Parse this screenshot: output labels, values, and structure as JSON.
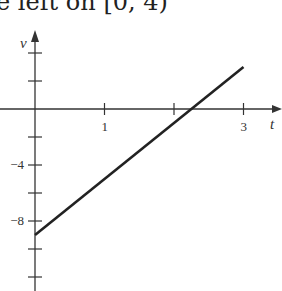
{
  "caption": "e left on [0, 4)",
  "chart_data": {
    "type": "line",
    "title": "",
    "xlabel": "t",
    "ylabel": "v",
    "x_ticks": [
      0,
      1,
      2,
      3
    ],
    "x_tick_labels": [
      "",
      "1",
      "",
      "3"
    ],
    "y_ticks": [
      4,
      2,
      0,
      -2,
      -4,
      -6,
      -8,
      -10,
      -12
    ],
    "y_tick_labels": [
      "",
      "",
      "",
      "",
      "-4",
      "",
      "-8",
      "",
      ""
    ],
    "xlim": [
      0,
      3.5
    ],
    "ylim": [
      -13,
      5.5
    ],
    "grid": false,
    "series": [
      {
        "name": "v(t) = 4t - 9",
        "x": [
          0,
          3
        ],
        "values": [
          -9,
          3
        ]
      }
    ],
    "x_intercept": 2.25
  }
}
